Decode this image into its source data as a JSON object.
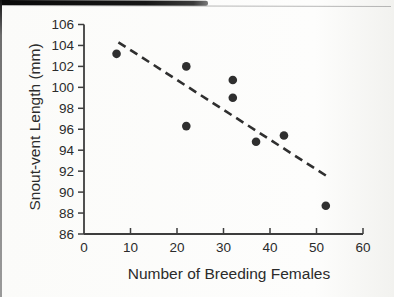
{
  "chart_data": {
    "type": "scatter",
    "title": "",
    "xlabel": "Number of Breeding Females",
    "ylabel": "Snout-vent Length (mm)",
    "xlim": [
      0,
      60
    ],
    "ylim": [
      86,
      106
    ],
    "x_ticks": [
      0,
      10,
      20,
      30,
      40,
      50,
      60
    ],
    "y_ticks": [
      86,
      88,
      90,
      92,
      94,
      96,
      98,
      100,
      102,
      104,
      106
    ],
    "grid": false,
    "legend": "none",
    "points": [
      {
        "x": 7,
        "y": 103.2
      },
      {
        "x": 22,
        "y": 102.0
      },
      {
        "x": 22,
        "y": 96.3
      },
      {
        "x": 32,
        "y": 100.7
      },
      {
        "x": 32,
        "y": 99.0
      },
      {
        "x": 37,
        "y": 94.8
      },
      {
        "x": 43,
        "y": 95.4
      },
      {
        "x": 52,
        "y": 88.7
      }
    ],
    "trend_line": {
      "style": "dashed",
      "x1": 7.4,
      "y1": 104.3,
      "x2": 52.3,
      "y2": 91.5
    },
    "point_color": "#2f2f2f",
    "axis_color": "#3d3d3d",
    "text_color": "#2b2b2b"
  }
}
